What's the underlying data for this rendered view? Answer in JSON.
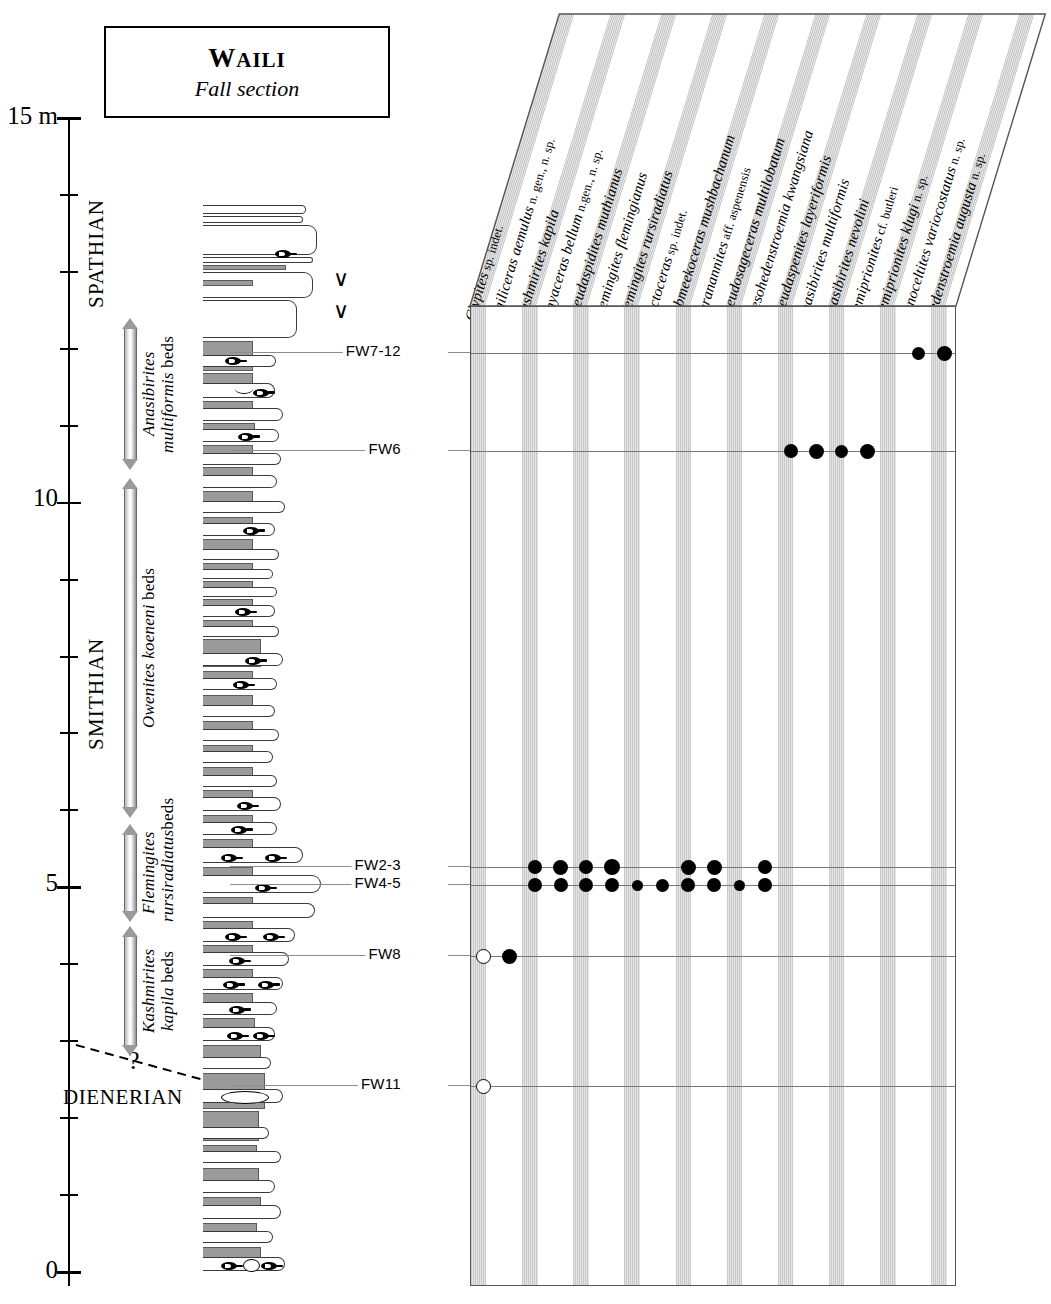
{
  "title": {
    "main_first": "W",
    "main_rest": "AILI",
    "sub": "Fall section"
  },
  "axis": {
    "unit_label": "15 m",
    "labels": [
      {
        "text": "15 m",
        "y": 118
      },
      {
        "text": "10",
        "y": 500
      },
      {
        "text": "5",
        "y": 885
      },
      {
        "text": "0",
        "y": 1272
      }
    ],
    "tick_count": 16,
    "range_m": [
      0,
      15
    ]
  },
  "stages": [
    {
      "name": "SPATHIAN",
      "orientation": "vertical",
      "top": 168,
      "height": 140
    },
    {
      "name": "SMITHIAN",
      "orientation": "vertical",
      "top": 560,
      "height": 190
    },
    {
      "name": "DIENERIAN",
      "orientation": "horizontal",
      "top": 1085
    }
  ],
  "zones": [
    {
      "label_italic": "Anasibirites\nmultiformis",
      "label_roman": " beds",
      "top": 318,
      "height": 152,
      "arrow": "double"
    },
    {
      "label_italic": "Owenites koeneni",
      "label_roman": " beds",
      "top": 478,
      "height": 340,
      "arrow": "double"
    },
    {
      "label_italic": "Flemingites\nrursiradiatus",
      "label_roman": "beds",
      "top": 824,
      "height": 98,
      "arrow": "double"
    },
    {
      "label_italic": "Kashmirites\nkapila",
      "label_roman": " beds",
      "top": 926,
      "height": 130,
      "arrow": "double"
    }
  ],
  "boundary_query": "?",
  "samples": [
    {
      "id": "FW7-12",
      "y": 352
    },
    {
      "id": "FW6",
      "y": 450
    },
    {
      "id": "FW2-3",
      "y": 866
    },
    {
      "id": "FW4-5",
      "y": 884
    },
    {
      "id": "FW8",
      "y": 955
    },
    {
      "id": "FW11",
      "y": 1085
    }
  ],
  "chart_data": {
    "type": "table",
    "xlabel": "Taxa",
    "ylabel": "Stratigraphic level (m)",
    "legend": [
      "filled circle = present",
      "open circle = questionable / rare"
    ],
    "categories": [
      {
        "genus": "Clypites",
        "species": "sp. indet."
      },
      {
        "genus": "Wailiceras",
        "species": "aemulus",
        "suffix": "n. gen., n. sp."
      },
      {
        "genus": "Kashmirites",
        "species": "kapila"
      },
      {
        "genus": "Jinyaceras",
        "species": "bellum",
        "suffix": "n.gen., n. sp."
      },
      {
        "genus": "Pseudaspidites",
        "species": "muthianus"
      },
      {
        "genus": "Flemingites",
        "species": "flemingianus"
      },
      {
        "genus": "Flemingites",
        "species": "rursiradiatus"
      },
      {
        "genus": "Arctoceras",
        "species": "sp. indet."
      },
      {
        "genus": "Submeekoceras",
        "species": "mushbachanum"
      },
      {
        "genus": "Paranannites",
        "species": "aff. aspenensis"
      },
      {
        "genus": "Pseudosageceras",
        "species": "multilobatum"
      },
      {
        "genus": "Mesohedenstroemia",
        "species": "kwangsiana"
      },
      {
        "genus": "Pseudaspenites",
        "species": "layeriformis"
      },
      {
        "genus": "Anasibirites",
        "species": "multiformis"
      },
      {
        "genus": "Anasibirites",
        "species": "nevolini"
      },
      {
        "genus": "Hemiprionites",
        "species": "cf. butleri"
      },
      {
        "genus": "Hemiprionites",
        "species": "klugi",
        "suffix": "n. sp."
      },
      {
        "genus": "Xenoceltites",
        "species": "variocostatus",
        "suffix": "n. sp."
      },
      {
        "genus": "Hedenstroemia",
        "species": "augusta",
        "suffix": "n. sp."
      }
    ],
    "rows": [
      {
        "sample": "FW7-12",
        "y": 352,
        "occurrences": [
          {
            "col": 18,
            "state": "present",
            "size": 13
          },
          {
            "col": 19,
            "state": "present",
            "size": 15
          }
        ]
      },
      {
        "sample": "FW6",
        "y": 450,
        "occurrences": [
          {
            "col": 13,
            "state": "present",
            "size": 14
          },
          {
            "col": 14,
            "state": "present",
            "size": 15
          },
          {
            "col": 15,
            "state": "present",
            "size": 13
          },
          {
            "col": 16,
            "state": "present",
            "size": 15
          }
        ]
      },
      {
        "sample": "FW2-3",
        "y": 866,
        "occurrences": [
          {
            "col": 3,
            "state": "present",
            "size": 14
          },
          {
            "col": 4,
            "state": "present",
            "size": 15
          },
          {
            "col": 5,
            "state": "present",
            "size": 14
          },
          {
            "col": 6,
            "state": "present",
            "size": 16
          },
          {
            "col": 9,
            "state": "present",
            "size": 15
          },
          {
            "col": 10,
            "state": "present",
            "size": 15
          },
          {
            "col": 12,
            "state": "present",
            "size": 14
          }
        ]
      },
      {
        "sample": "FW4-5",
        "y": 884,
        "occurrences": [
          {
            "col": 3,
            "state": "present",
            "size": 14
          },
          {
            "col": 4,
            "state": "present",
            "size": 14
          },
          {
            "col": 5,
            "state": "present",
            "size": 14
          },
          {
            "col": 6,
            "state": "present",
            "size": 14
          },
          {
            "col": 7,
            "state": "present",
            "size": 11
          },
          {
            "col": 8,
            "state": "present",
            "size": 13
          },
          {
            "col": 9,
            "state": "present",
            "size": 14
          },
          {
            "col": 10,
            "state": "present",
            "size": 14
          },
          {
            "col": 11,
            "state": "present",
            "size": 11
          },
          {
            "col": 12,
            "state": "present",
            "size": 14
          }
        ]
      },
      {
        "sample": "FW8",
        "y": 955,
        "occurrences": [
          {
            "col": 1,
            "state": "questionable",
            "size": 15
          },
          {
            "col": 2,
            "state": "present",
            "size": 15
          }
        ]
      },
      {
        "sample": "FW11",
        "y": 1085,
        "occurrences": [
          {
            "col": 1,
            "state": "questionable",
            "size": 15
          }
        ]
      }
    ]
  },
  "lithology": {
    "legend": {
      "marl": "recessive marl / shale",
      "limestone": "limestone bed"
    },
    "beds": [
      {
        "t": 0,
        "h": 9,
        "w": 103,
        "k": "lime"
      },
      {
        "t": 11,
        "h": 7,
        "w": 100,
        "k": "lime"
      },
      {
        "t": 20,
        "h": 30,
        "w": 114,
        "k": "lime"
      },
      {
        "t": 52,
        "h": 6,
        "w": 110,
        "k": "lime",
        "fossil": {
          "x": 72,
          "y": -6
        }
      },
      {
        "t": 60,
        "h": 5,
        "w": 83,
        "k": "marl"
      },
      {
        "t": 67,
        "h": 26,
        "w": 110,
        "k": "lime"
      },
      {
        "t": 75,
        "h": 6,
        "w": 50,
        "k": "marl"
      },
      {
        "t": 95,
        "h": 38,
        "w": 94,
        "k": "lime"
      },
      {
        "t": 136,
        "h": 30,
        "w": 50,
        "k": "marl"
      },
      {
        "t": 150,
        "h": 12,
        "w": 73,
        "k": "lime",
        "fossil": {
          "x": 22,
          "y": 0
        }
      },
      {
        "t": 168,
        "h": 18,
        "w": 50,
        "k": "marl"
      },
      {
        "t": 178,
        "h": 15,
        "w": 72,
        "k": "lime",
        "curve": {
          "x": 32,
          "y": 1
        },
        "fossil": {
          "x": 50,
          "y": 2
        }
      },
      {
        "t": 196,
        "h": 14,
        "w": 50,
        "k": "marl"
      },
      {
        "t": 203,
        "h": 13,
        "w": 80,
        "k": "lime"
      },
      {
        "t": 218,
        "h": 12,
        "w": 52,
        "k": "marl"
      },
      {
        "t": 224,
        "h": 13,
        "w": 76,
        "k": "lime",
        "fossil": {
          "x": 35,
          "y": 1
        }
      },
      {
        "t": 240,
        "h": 15,
        "w": 50,
        "k": "marl"
      },
      {
        "t": 248,
        "h": 12,
        "w": 78,
        "k": "lime"
      },
      {
        "t": 262,
        "h": 14,
        "w": 50,
        "k": "marl"
      },
      {
        "t": 270,
        "h": 13,
        "w": 74,
        "k": "lime"
      },
      {
        "t": 286,
        "h": 17,
        "w": 50,
        "k": "marl"
      },
      {
        "t": 296,
        "h": 12,
        "w": 82,
        "k": "lime"
      },
      {
        "t": 312,
        "h": 11,
        "w": 50,
        "k": "marl"
      },
      {
        "t": 318,
        "h": 13,
        "w": 72,
        "k": "lime",
        "fossil": {
          "x": 40,
          "y": 1
        }
      },
      {
        "t": 334,
        "h": 16,
        "w": 50,
        "k": "marl"
      },
      {
        "t": 344,
        "h": 11,
        "w": 76,
        "k": "lime"
      },
      {
        "t": 358,
        "h": 9,
        "w": 50,
        "k": "marl"
      },
      {
        "t": 364,
        "h": 10,
        "w": 70,
        "k": "lime"
      },
      {
        "t": 376,
        "h": 10,
        "w": 50,
        "k": "marl"
      },
      {
        "t": 382,
        "h": 10,
        "w": 74,
        "k": "lime"
      },
      {
        "t": 394,
        "h": 11,
        "w": 50,
        "k": "marl"
      },
      {
        "t": 400,
        "h": 12,
        "w": 72,
        "k": "lime",
        "fossil": {
          "x": 32,
          "y": 1
        }
      },
      {
        "t": 415,
        "h": 10,
        "w": 50,
        "k": "marl"
      },
      {
        "t": 421,
        "h": 11,
        "w": 76,
        "k": "lime"
      },
      {
        "t": 434,
        "h": 28,
        "w": 58,
        "k": "marl"
      },
      {
        "t": 448,
        "h": 13,
        "w": 80,
        "k": "lime",
        "fossil": {
          "x": 42,
          "y": 1
        }
      },
      {
        "t": 466,
        "h": 13,
        "w": 50,
        "k": "marl"
      },
      {
        "t": 473,
        "h": 12,
        "w": 74,
        "k": "lime",
        "fossil": {
          "x": 30,
          "y": 1
        }
      },
      {
        "t": 490,
        "h": 22,
        "w": 50,
        "k": "marl"
      },
      {
        "t": 500,
        "h": 12,
        "w": 72,
        "k": "lime"
      },
      {
        "t": 516,
        "h": 14,
        "w": 50,
        "k": "marl"
      },
      {
        "t": 524,
        "h": 12,
        "w": 76,
        "k": "lime"
      },
      {
        "t": 540,
        "h": 10,
        "w": 50,
        "k": "marl"
      },
      {
        "t": 546,
        "h": 12,
        "w": 70,
        "k": "lime"
      },
      {
        "t": 562,
        "h": 13,
        "w": 50,
        "k": "marl"
      },
      {
        "t": 570,
        "h": 12,
        "w": 74,
        "k": "lime"
      },
      {
        "t": 585,
        "h": 12,
        "w": 50,
        "k": "marl"
      },
      {
        "t": 592,
        "h": 14,
        "w": 78,
        "k": "lime",
        "fossil": {
          "x": 34,
          "y": 2
        }
      },
      {
        "t": 610,
        "h": 12,
        "w": 50,
        "k": "marl"
      },
      {
        "t": 617,
        "h": 13,
        "w": 74,
        "k": "lime",
        "fossil": {
          "x": 28,
          "y": 1
        }
      },
      {
        "t": 634,
        "h": 14,
        "w": 50,
        "k": "marl"
      },
      {
        "t": 642,
        "h": 16,
        "w": 100,
        "k": "lime",
        "fossil": {
          "x": 18,
          "y": 3
        },
        "fossil2": {
          "x": 62,
          "y": 3
        }
      },
      {
        "t": 662,
        "h": 12,
        "w": 50,
        "k": "marl"
      },
      {
        "t": 670,
        "h": 18,
        "w": 118,
        "k": "lime",
        "fossil": {
          "x": 52,
          "y": 4
        }
      },
      {
        "t": 692,
        "h": 10,
        "w": 50,
        "k": "marl"
      },
      {
        "t": 698,
        "h": 15,
        "w": 112,
        "k": "lime"
      },
      {
        "t": 716,
        "h": 12,
        "w": 50,
        "k": "marl"
      },
      {
        "t": 723,
        "h": 14,
        "w": 92,
        "k": "lime",
        "fossil": {
          "x": 22,
          "y": 2
        },
        "fossil2": {
          "x": 60,
          "y": 2
        }
      },
      {
        "t": 740,
        "h": 12,
        "w": 50,
        "k": "marl"
      },
      {
        "t": 747,
        "h": 14,
        "w": 86,
        "k": "lime",
        "fossil": {
          "x": 26,
          "y": 2
        }
      },
      {
        "t": 764,
        "h": 14,
        "w": 50,
        "k": "marl"
      },
      {
        "t": 772,
        "h": 13,
        "w": 80,
        "k": "lime",
        "fossil": {
          "x": 20,
          "y": 1
        },
        "fossil2": {
          "x": 55,
          "y": 1
        }
      },
      {
        "t": 788,
        "h": 16,
        "w": 50,
        "k": "marl"
      },
      {
        "t": 797,
        "h": 13,
        "w": 74,
        "k": "lime",
        "fossil": {
          "x": 26,
          "y": 1
        }
      },
      {
        "t": 813,
        "h": 16,
        "w": 52,
        "k": "marl"
      },
      {
        "t": 822,
        "h": 14,
        "w": 72,
        "k": "lime",
        "fossil": {
          "x": 24,
          "y": 2
        },
        "fossil2": {
          "x": 50,
          "y": 2
        }
      },
      {
        "t": 840,
        "h": 20,
        "w": 58,
        "k": "marl"
      },
      {
        "t": 852,
        "h": 12,
        "w": 68,
        "k": "lime"
      },
      {
        "t": 868,
        "h": 36,
        "w": 62,
        "k": "marl"
      },
      {
        "t": 884,
        "h": 14,
        "w": 80,
        "k": "lime",
        "ellipse": {
          "x": 18,
          "y": 2,
          "w": 46,
          "h": 11
        }
      },
      {
        "t": 906,
        "h": 30,
        "w": 56,
        "k": "marl"
      },
      {
        "t": 922,
        "h": 12,
        "w": 66,
        "k": "lime"
      },
      {
        "t": 940,
        "h": 10,
        "w": 54,
        "k": "marl"
      },
      {
        "t": 946,
        "h": 12,
        "w": 78,
        "k": "lime"
      },
      {
        "t": 963,
        "h": 24,
        "w": 56,
        "k": "marl"
      },
      {
        "t": 975,
        "h": 13,
        "w": 72,
        "k": "lime"
      },
      {
        "t": 992,
        "h": 18,
        "w": 58,
        "k": "marl"
      },
      {
        "t": 1000,
        "h": 14,
        "w": 78,
        "k": "lime"
      },
      {
        "t": 1018,
        "h": 16,
        "w": 54,
        "k": "marl"
      },
      {
        "t": 1026,
        "h": 12,
        "w": 70,
        "k": "lime"
      },
      {
        "t": 1042,
        "h": 20,
        "w": 58,
        "k": "marl"
      },
      {
        "t": 1052,
        "h": 14,
        "w": 82,
        "k": "lime",
        "fossil": {
          "x": 18,
          "y": 2
        },
        "fossil2": {
          "x": 58,
          "y": 2
        },
        "nodule": {
          "x": 40,
          "y": 2,
          "w": 15,
          "h": 11
        }
      }
    ]
  },
  "vee_symbols": [
    {
      "x": 333,
      "y": 268,
      "glyph": "∨"
    },
    {
      "x": 333,
      "y": 300,
      "glyph": "∨"
    }
  ]
}
